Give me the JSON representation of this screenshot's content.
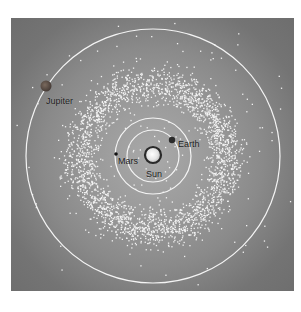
{
  "diagram": {
    "title": "",
    "background": {
      "inner": "#a9a9a9",
      "outer": "#6a6a6a"
    },
    "center": {
      "x": 153,
      "y": 156
    },
    "sun": {
      "label": "Sun",
      "x": 153,
      "y": 155,
      "radius": 8,
      "label_x": 146,
      "label_y": 169
    },
    "orbits": [
      {
        "name": "Earth",
        "radius": 26
      },
      {
        "name": "Mars",
        "radius": 38
      },
      {
        "name": "Jupiter",
        "radius": 127
      }
    ],
    "planets": [
      {
        "name": "Earth",
        "label": "Earth",
        "x": 172,
        "y": 140,
        "radius": 3.2,
        "color": "#2b2b2b",
        "label_x": 178,
        "label_y": 139
      },
      {
        "name": "Mars",
        "label": "Mars",
        "x": 116,
        "y": 154,
        "radius": 1.8,
        "color": "#111111",
        "label_x": 118,
        "label_y": 156
      },
      {
        "name": "Jupiter",
        "label": "Jupiter",
        "x": 46,
        "y": 86,
        "radius": 5.5,
        "color": "#5a4a3e",
        "label_x": 46,
        "label_y": 96
      }
    ],
    "asteroid_belt": {
      "label": "",
      "inner_radius": 48,
      "outer_radius": 98,
      "count": 2600,
      "stray_count": 70,
      "stray_inner": 95,
      "stray_outer": 150,
      "dot_color": "#f2f2f2",
      "dot_size": 1.3
    }
  }
}
